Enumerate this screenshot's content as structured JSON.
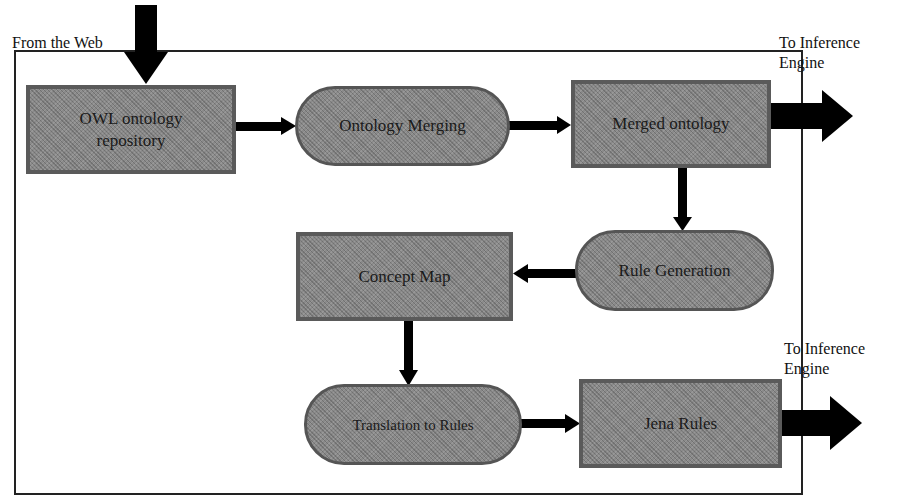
{
  "diagram": {
    "type": "flowchart",
    "external_labels": {
      "input_source": "From the Web",
      "output_top": [
        "To Inference",
        "Engine"
      ],
      "output_bottom": [
        "To Inference",
        "Engine"
      ]
    },
    "nodes": [
      {
        "id": "owl_repo",
        "shape": "rectangle",
        "lines": [
          "OWL ontology",
          "repository"
        ]
      },
      {
        "id": "ontology_merging",
        "shape": "rounded-pill",
        "lines": [
          "Ontology Merging"
        ]
      },
      {
        "id": "merged_ontology",
        "shape": "rectangle",
        "lines": [
          "Merged ontology"
        ]
      },
      {
        "id": "rule_generation",
        "shape": "rounded-pill",
        "lines": [
          "Rule Generation"
        ]
      },
      {
        "id": "concept_map",
        "shape": "rectangle",
        "lines": [
          "Concept Map"
        ]
      },
      {
        "id": "translation_to_rules",
        "shape": "rounded-pill",
        "lines": [
          "Translation to Rules"
        ]
      },
      {
        "id": "jena_rules",
        "shape": "rectangle",
        "lines": [
          "Jena Rules"
        ]
      }
    ],
    "edges": [
      {
        "from": "web",
        "to": "owl_repo"
      },
      {
        "from": "owl_repo",
        "to": "ontology_merging"
      },
      {
        "from": "ontology_merging",
        "to": "merged_ontology"
      },
      {
        "from": "merged_ontology",
        "to": "inference_engine"
      },
      {
        "from": "merged_ontology",
        "to": "rule_generation"
      },
      {
        "from": "rule_generation",
        "to": "concept_map"
      },
      {
        "from": "concept_map",
        "to": "translation_to_rules"
      },
      {
        "from": "translation_to_rules",
        "to": "jena_rules"
      },
      {
        "from": "jena_rules",
        "to": "inference_engine"
      }
    ],
    "colors": {
      "node_fill": "#8a8a8a",
      "node_border": "#5a5a5a",
      "arrow": "#000000",
      "frame": "#222222"
    }
  }
}
